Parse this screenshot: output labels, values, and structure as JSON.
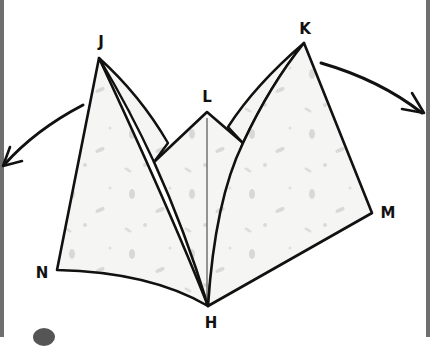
{
  "diagram": {
    "labels": {
      "J": "J",
      "K": "K",
      "L": "L",
      "M": "M",
      "N": "N",
      "H": "H"
    },
    "colors": {
      "stroke": "#111111",
      "paper_fill": "#f4f4f2",
      "speckle": "#b8b8b8",
      "border": "#6f6f6f",
      "background": "#ffffff"
    },
    "arrows": [
      {
        "name": "left-arrow",
        "direction": "outward-left"
      },
      {
        "name": "right-arrow",
        "direction": "outward-right"
      }
    ]
  }
}
